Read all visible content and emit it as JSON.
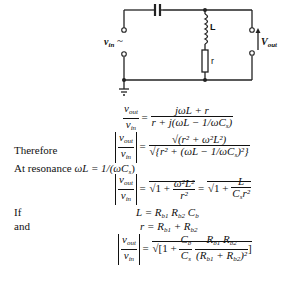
{
  "circuit": {
    "input_label": "v",
    "input_sub": "in",
    "input_source_symbol": "~",
    "inductor_label": "L",
    "resistor_label": "r",
    "output_label": "V",
    "output_sub": "out"
  },
  "equations": {
    "eq1": {
      "lhs_num": "v",
      "lhs_num_sub": "out",
      "lhs_den": "v",
      "lhs_den_sub": "in",
      "equals": "=",
      "rhs_num": "jωL + r",
      "rhs_den": "r + j(ωL − 1/ωC",
      "rhs_den_sub": "s",
      "rhs_den_close": ")"
    },
    "eq2": {
      "label": "Therefore",
      "lhs_num": "v",
      "lhs_num_sub": "out",
      "lhs_den": "v",
      "lhs_den_sub": "in",
      "equals": "=",
      "rhs_num": "√(r² + ω²L²)",
      "rhs_den": "√{r² + (ωL − 1/ωC",
      "rhs_den_sub": "s",
      "rhs_den_close": ")²}"
    },
    "resonance": {
      "label": "At resonance",
      "condition": "ωL = 1/(ωC",
      "condition_sub": "s",
      "condition_close": ")"
    },
    "eq3": {
      "lhs_num": "v",
      "lhs_num_sub": "out",
      "lhs_den": "v",
      "lhs_den_sub": "in",
      "equals1": "=",
      "mid_prefix": "1 +",
      "mid_num": "ω²L²",
      "mid_den": "r²",
      "equals2": "=",
      "right_prefix": "1 +",
      "right_num": "L",
      "right_den": "C",
      "right_den_sub": "s",
      "right_den_tail": "r²"
    },
    "eq4": {
      "label": "If",
      "text": "L = R",
      "sub1": "b1",
      "mid": " R",
      "sub2": "b2",
      "tail": " C",
      "sub3": "b"
    },
    "eq5": {
      "label": "and",
      "text": "r = R",
      "sub1": "b1",
      "mid": " + R",
      "sub2": "b2"
    },
    "eq6": {
      "lhs_num": "v",
      "lhs_num_sub": "out",
      "lhs_den": "v",
      "lhs_den_sub": "in",
      "equals": "=",
      "prefix": "1 +",
      "f1_num": "C",
      "f1_num_sub": "b",
      "f1_den": "C",
      "f1_den_sub": "s",
      "f2_num": "R",
      "f2_num_sub1": "b1",
      "f2_num_mid": " R",
      "f2_num_sub2": "b2",
      "f2_den": "(R",
      "f2_den_sub1": "b1",
      "f2_den_mid": " + R",
      "f2_den_sub2": "b2",
      "f2_den_close": ")²"
    }
  }
}
